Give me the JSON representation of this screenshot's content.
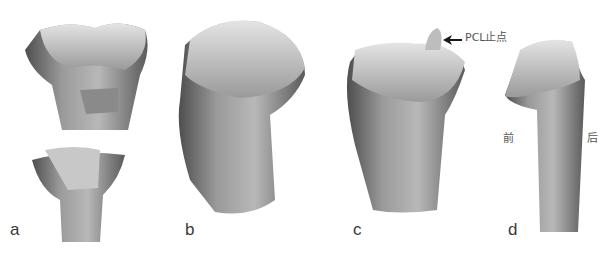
{
  "figure": {
    "panels": [
      {
        "id": "a",
        "label": "a"
      },
      {
        "id": "b",
        "label": "b"
      },
      {
        "id": "c",
        "label": "c",
        "annotation": "PCL止点"
      },
      {
        "id": "d",
        "label": "d",
        "anterior": "前",
        "posterior": "后"
      }
    ],
    "colors": {
      "bone_light": "#d8d8d8",
      "bone_mid": "#a8a8a8",
      "bone_dark": "#6e6e6e",
      "text": "#3a3a3a"
    }
  }
}
